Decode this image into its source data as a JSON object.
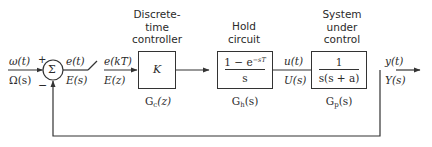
{
  "diagram": {
    "type": "block_diagram",
    "colors": {
      "line": "#333333",
      "text": "#2a2a2a",
      "background": "#ffffff"
    }
  },
  "input": {
    "time_signal": "ω(t)",
    "laplace_signal": "Ω(s)"
  },
  "summing_junction": {
    "symbol": "Σ",
    "plus_sign": "+",
    "minus_sign": "−"
  },
  "error": {
    "time_signal": "e(t)",
    "laplace_signal": "E(s)"
  },
  "sampler": {
    "icon": "switch-icon",
    "sampled_signal": "e(kT)",
    "z_signal": "E(z)"
  },
  "controller": {
    "caption_lines": [
      "Discrete-",
      "time",
      "controller"
    ],
    "content": "K",
    "transfer_name": "G",
    "transfer_sub": "c",
    "transfer_arg": "(z)"
  },
  "hold": {
    "caption_lines": [
      "Hold",
      "circuit"
    ],
    "numerator": "1 − e",
    "numerator_exp": "−sT",
    "denominator": "s",
    "transfer_name": "G",
    "transfer_sub": "h",
    "transfer_arg": "(s)"
  },
  "control_signal": {
    "time_signal": "u(t)",
    "laplace_signal": "U(s)"
  },
  "plant": {
    "caption_lines": [
      "System",
      "under",
      "control"
    ],
    "numerator": "1",
    "denominator": "s(s + a)",
    "transfer_name": "G",
    "transfer_sub": "p",
    "transfer_arg": "(s)"
  },
  "output": {
    "time_signal": "y(t)",
    "laplace_signal": "Y(s)"
  }
}
